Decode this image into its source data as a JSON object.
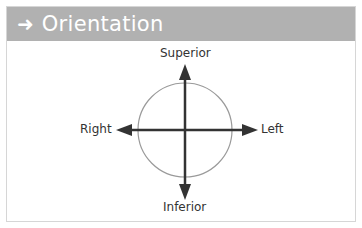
{
  "header": {
    "icon": "arrow-right-icon",
    "icon_glyph": "➜",
    "title": "Orientation"
  },
  "diagram": {
    "labels": {
      "top": "Superior",
      "bottom": "Inferior",
      "left": "Right",
      "right": "Left"
    },
    "colors": {
      "header_bg": "#b1b1b1",
      "arrow": "#333333",
      "circle": "#9a9a9a"
    }
  }
}
